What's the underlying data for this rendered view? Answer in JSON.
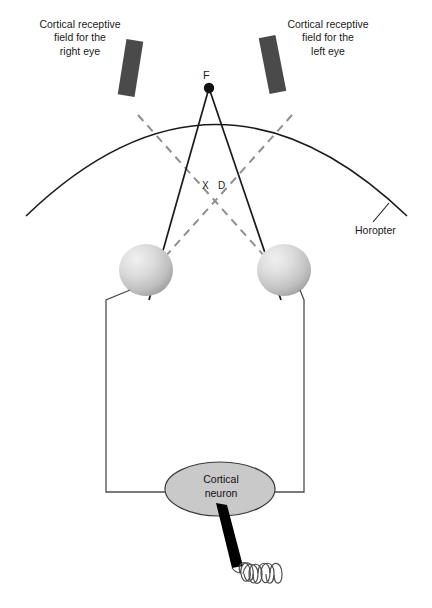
{
  "figure": {
    "title_visible": false,
    "background_color": "#ffffff",
    "width": 432,
    "height": 608
  },
  "labels": {
    "cortical_rf_right": "Cortical receptive\nfield for the\nright eye",
    "cortical_rf_left": "Cortical receptive\nfield for the\nleft eye",
    "horopter": "Horopter",
    "fixation_point": "F",
    "crossing_point": "X",
    "disparity": "D"
  },
  "neuron": {
    "line1": "Cortical",
    "line2": "neuron"
  },
  "colors": {
    "stroke_dark": "#1a1a1a",
    "receptive_field_bar": "#4a4a4a",
    "dashed_ray": "#8f8f8f",
    "eye_fill_light": "#e6e6e6",
    "eye_fill_mid": "#bdbdbd",
    "eye_fill_dark": "#9a9a9a",
    "neuron_fill": "#c9c9c9",
    "wire": "#4d4d4d",
    "electrode": "#000000"
  },
  "elements": {
    "horopter_arc": "curved arc through fixation point F",
    "solid_rays": "solid lines from F to each eye",
    "dashed_rays": "dashed lines from each eye crossing at X",
    "left_eye": "shaded sphere eyeball (observer right eye, drawn left)",
    "right_eye": "shaded sphere eyeball (observer left eye, drawn right)",
    "recording_wires": "wires from each eye down to cortical neuron",
    "electrode": "black triangular recording electrode",
    "spike_trace": "coiled spike train squiggle"
  }
}
